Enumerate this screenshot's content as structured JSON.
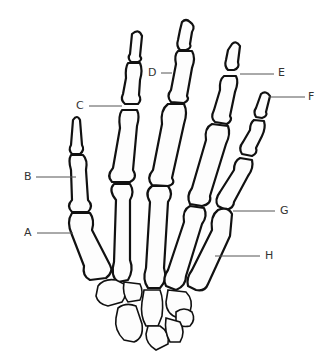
{
  "diagram": {
    "colors": {
      "outline": "#111111",
      "bone_fill": "#fdfdfd",
      "leader": "#555555",
      "label_text": "#333333"
    },
    "labels": [
      {
        "id": "A",
        "text": "A",
        "x": 24,
        "y": 227
      },
      {
        "id": "B",
        "text": "B",
        "x": 24,
        "y": 171
      },
      {
        "id": "C",
        "text": "C",
        "x": 76,
        "y": 100
      },
      {
        "id": "D",
        "text": "D",
        "x": 148,
        "y": 67
      },
      {
        "id": "E",
        "text": "E",
        "x": 278,
        "y": 67
      },
      {
        "id": "F",
        "text": "F",
        "x": 308,
        "y": 91
      },
      {
        "id": "G",
        "text": "G",
        "x": 280,
        "y": 205
      },
      {
        "id": "H",
        "text": "H",
        "x": 265,
        "y": 250
      }
    ]
  }
}
